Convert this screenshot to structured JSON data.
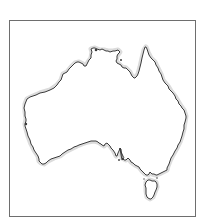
{
  "map": {
    "subject": "Australia",
    "style": "outline",
    "colors": {
      "background": "#ffffff",
      "frame": "#6e6e6e",
      "coastline": "#3a3a3a",
      "coast_halo": "#d9d9d9",
      "land": "#ffffff"
    },
    "regions": [
      {
        "name": "Mainland Australia"
      },
      {
        "name": "Tasmania"
      }
    ]
  }
}
